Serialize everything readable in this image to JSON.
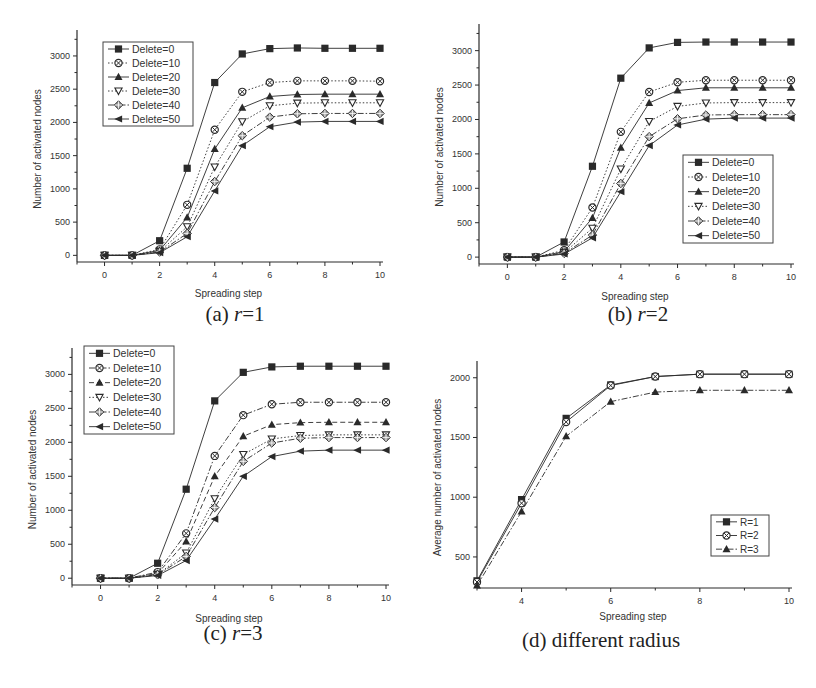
{
  "figure": {
    "panels": [
      {
        "id": "a",
        "caption_prefix": "(a) ",
        "caption_var": "r",
        "caption_suffix": "=1"
      },
      {
        "id": "b",
        "caption_prefix": "(b) ",
        "caption_var": "r",
        "caption_suffix": "=2"
      },
      {
        "id": "c",
        "caption_prefix": "(c) ",
        "caption_var": "r",
        "caption_suffix": "=3"
      },
      {
        "id": "d",
        "caption_prefix": "(d) different radius",
        "caption_var": "",
        "caption_suffix": ""
      }
    ]
  },
  "chart_data": [
    {
      "type": "line",
      "title": "(a) r=1",
      "xlabel": "Spreading step",
      "ylabel": "Number of activated nodes",
      "x": [
        0,
        1,
        2,
        3,
        4,
        5,
        6,
        7,
        8,
        9,
        10
      ],
      "xticks": [
        0,
        2,
        4,
        6,
        8,
        10
      ],
      "yticks": [
        0,
        500,
        1000,
        1500,
        2000,
        2500,
        3000
      ],
      "xlim": [
        -1,
        10
      ],
      "ylim": [
        -100,
        3300
      ],
      "grid": false,
      "legend_position": "upper left",
      "series": [
        {
          "name": "Delete=0",
          "marker": "square",
          "dash": "solid",
          "values": [
            0,
            0,
            220,
            1310,
            2600,
            3030,
            3110,
            3120,
            3115,
            3115,
            3115
          ]
        },
        {
          "name": "Delete=10",
          "marker": "circle-x",
          "dash": "dot",
          "values": [
            0,
            0,
            90,
            760,
            1890,
            2460,
            2600,
            2625,
            2625,
            2625,
            2620
          ]
        },
        {
          "name": "Delete=20",
          "marker": "triangle-up",
          "dash": "solid",
          "values": [
            0,
            0,
            75,
            570,
            1600,
            2220,
            2390,
            2420,
            2425,
            2425,
            2425
          ]
        },
        {
          "name": "Delete=30",
          "marker": "triangle-down",
          "dash": "dot",
          "values": [
            0,
            0,
            60,
            430,
            1330,
            2010,
            2250,
            2290,
            2295,
            2295,
            2295
          ]
        },
        {
          "name": "Delete=40",
          "marker": "diamond",
          "dash": "dashdot",
          "values": [
            0,
            0,
            50,
            330,
            1110,
            1800,
            2080,
            2130,
            2135,
            2135,
            2135
          ]
        },
        {
          "name": "Delete=50",
          "marker": "triangle-left",
          "dash": "solid",
          "values": [
            0,
            0,
            40,
            280,
            970,
            1650,
            1935,
            2005,
            2015,
            2015,
            2015
          ]
        }
      ]
    },
    {
      "type": "line",
      "title": "(b) r=2",
      "xlabel": "Spreading step",
      "ylabel": "Number of activated nodes",
      "x": [
        0,
        1,
        2,
        3,
        4,
        5,
        6,
        7,
        8,
        9,
        10
      ],
      "xticks": [
        0,
        2,
        4,
        6,
        8,
        10
      ],
      "yticks": [
        0,
        500,
        1000,
        1500,
        2000,
        2500,
        3000
      ],
      "xlim": [
        -1,
        10
      ],
      "ylim": [
        -100,
        3300
      ],
      "grid": false,
      "legend_position": "lower right",
      "series": [
        {
          "name": "Delete=0",
          "marker": "square",
          "dash": "solid",
          "values": [
            0,
            0,
            220,
            1320,
            2600,
            3040,
            3120,
            3125,
            3125,
            3125,
            3125
          ]
        },
        {
          "name": "Delete=10",
          "marker": "circle-x",
          "dash": "dot",
          "values": [
            0,
            0,
            100,
            720,
            1820,
            2400,
            2540,
            2570,
            2570,
            2570,
            2570
          ]
        },
        {
          "name": "Delete=20",
          "marker": "triangle-up",
          "dash": "solid",
          "values": [
            0,
            0,
            80,
            570,
            1590,
            2240,
            2420,
            2460,
            2460,
            2460,
            2460
          ]
        },
        {
          "name": "Delete=30",
          "marker": "triangle-down",
          "dash": "dot",
          "values": [
            0,
            0,
            65,
            420,
            1280,
            1970,
            2190,
            2240,
            2245,
            2245,
            2245
          ]
        },
        {
          "name": "Delete=40",
          "marker": "diamond",
          "dash": "dashdot",
          "values": [
            0,
            0,
            55,
            320,
            1070,
            1750,
            2010,
            2065,
            2070,
            2070,
            2070
          ]
        },
        {
          "name": "Delete=50",
          "marker": "triangle-left",
          "dash": "solid",
          "values": [
            0,
            0,
            45,
            280,
            950,
            1620,
            1920,
            2005,
            2020,
            2020,
            2020
          ]
        }
      ]
    },
    {
      "type": "line",
      "title": "(c) r=3",
      "xlabel": "Spreading step",
      "ylabel": "Number of activated nodes",
      "x": [
        0,
        1,
        2,
        3,
        4,
        5,
        6,
        7,
        8,
        9,
        10
      ],
      "xticks": [
        0,
        2,
        4,
        6,
        8,
        10
      ],
      "yticks": [
        0,
        500,
        1000,
        1500,
        2000,
        2500,
        3000
      ],
      "xlim": [
        -1,
        10
      ],
      "ylim": [
        -100,
        3300
      ],
      "grid": false,
      "legend_position": "upper left",
      "series": [
        {
          "name": "Delete=0",
          "marker": "square",
          "dash": "solid",
          "values": [
            0,
            0,
            220,
            1310,
            2610,
            3030,
            3110,
            3120,
            3120,
            3120,
            3120
          ]
        },
        {
          "name": "Delete=10",
          "marker": "circle-x",
          "dash": "dashdot",
          "values": [
            0,
            0,
            90,
            660,
            1800,
            2400,
            2560,
            2590,
            2590,
            2590,
            2590
          ]
        },
        {
          "name": "Delete=20",
          "marker": "triangle-up",
          "dash": "dash",
          "values": [
            0,
            0,
            70,
            540,
            1500,
            2090,
            2260,
            2290,
            2295,
            2295,
            2295
          ]
        },
        {
          "name": "Delete=30",
          "marker": "triangle-down",
          "dash": "dot",
          "values": [
            0,
            0,
            55,
            370,
            1170,
            1820,
            2050,
            2100,
            2110,
            2110,
            2110
          ]
        },
        {
          "name": "Delete=40",
          "marker": "diamond",
          "dash": "dashdot",
          "values": [
            0,
            0,
            50,
            320,
            1040,
            1720,
            1990,
            2060,
            2070,
            2070,
            2070
          ]
        },
        {
          "name": "Delete=50",
          "marker": "triangle-left",
          "dash": "solid",
          "values": [
            0,
            0,
            40,
            260,
            870,
            1500,
            1790,
            1870,
            1885,
            1885,
            1885
          ]
        }
      ]
    },
    {
      "type": "line",
      "title": "(d) different radius",
      "xlabel": "Spreading step",
      "ylabel": "Average number of activated nodes",
      "x": [
        3,
        4,
        5,
        6,
        7,
        8,
        9,
        10
      ],
      "xticks": [
        4,
        6,
        8,
        10
      ],
      "yticks": [
        500,
        1000,
        1500,
        2000
      ],
      "xlim": [
        3,
        10
      ],
      "ylim": [
        240,
        2090
      ],
      "grid": false,
      "legend_position": "lower right",
      "series": [
        {
          "name": "R=1",
          "marker": "square",
          "dash": "solid",
          "values": [
            300,
            980,
            1660,
            1940,
            2010,
            2030,
            2030,
            2030
          ]
        },
        {
          "name": "R=2",
          "marker": "circle-x",
          "dash": "solid",
          "values": [
            290,
            950,
            1630,
            1935,
            2010,
            2030,
            2030,
            2030
          ]
        },
        {
          "name": "R=3",
          "marker": "triangle-up",
          "dash": "dashdot",
          "values": [
            260,
            880,
            1510,
            1800,
            1880,
            1895,
            1895,
            1895
          ]
        }
      ]
    }
  ],
  "layout": {
    "panels": [
      {
        "left": 0,
        "top": 0,
        "plot": {
          "x0": 77,
          "y0": 36,
          "w": 303,
          "h": 226
        },
        "legend": {
          "x": 103,
          "y": 42,
          "w": 90,
          "h": 84
        },
        "caption_top": 302,
        "caption_cx": 235,
        "xlabel_y": 297
      },
      {
        "left": 408,
        "top": 0,
        "plot": {
          "x0": 71,
          "y0": 30,
          "w": 312,
          "h": 234
        },
        "legend": {
          "x": 275,
          "y": 155,
          "w": 90,
          "h": 88
        },
        "caption_top": 302,
        "caption_cx": 230,
        "xlabel_y": 300
      },
      {
        "left": 0,
        "top": 340,
        "plot": {
          "x0": 72,
          "y0": 14,
          "w": 314,
          "h": 231
        },
        "legend": {
          "x": 84,
          "y": 6,
          "w": 90,
          "h": 88
        },
        "caption_top": 281,
        "caption_cx": 233,
        "xlabel_y": 282
      },
      {
        "left": 408,
        "top": 340,
        "plot": {
          "x0": 69,
          "y0": 27,
          "w": 312,
          "h": 221
        },
        "legend": {
          "x": 303,
          "y": 175,
          "w": 58,
          "h": 41
        },
        "caption_top": 288,
        "caption_cx": 193,
        "xlabel_y": 280
      }
    ],
    "ink": "#2a2a2a",
    "legend_border": "#444444"
  }
}
